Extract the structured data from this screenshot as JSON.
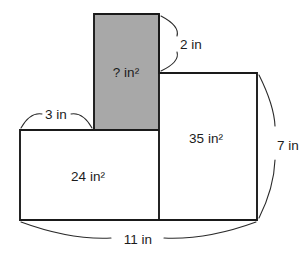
{
  "diagram": {
    "type": "geometry-figure",
    "units": "in",
    "colors": {
      "shaded_fill": "#a8a8a8",
      "unshaded_fill": "#ffffff",
      "stroke": "#1a1a1a",
      "leader_stroke": "#2a2a2a",
      "text": "#1c1c1c",
      "background": "#ffffff"
    },
    "regions": [
      {
        "id": "top-shaded-rectangle",
        "label": "? in²",
        "value": "?",
        "unit": "in²",
        "shaded": true,
        "fill": "#a8a8a8"
      },
      {
        "id": "left-rectangle",
        "label": "24 in²",
        "value": "24",
        "unit": "in²",
        "shaded": false,
        "fill": "#ffffff"
      },
      {
        "id": "right-rectangle",
        "label": "35 in²",
        "value": "35",
        "unit": "in²",
        "shaded": false,
        "fill": "#ffffff"
      }
    ],
    "dimensions": [
      {
        "id": "top-width",
        "label": "2 in",
        "value": "2",
        "unit": "in",
        "edge": "top-right-of-shaded-rectangle"
      },
      {
        "id": "left-top-width",
        "label": "3 in",
        "value": "3",
        "unit": "in",
        "edge": "top-of-left-rectangle"
      },
      {
        "id": "right-height",
        "label": "7 in",
        "value": "7",
        "unit": "in",
        "edge": "right-side-of-figure"
      },
      {
        "id": "bottom-width",
        "label": "11 in",
        "value": "11",
        "unit": "in",
        "edge": "bottom-of-figure"
      }
    ]
  }
}
